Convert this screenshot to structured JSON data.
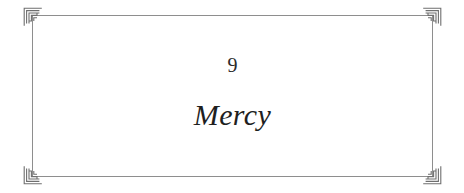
{
  "page": {
    "background_color": "#ffffff",
    "type": "book-chapter-opening-page"
  },
  "frame": {
    "rule_color": "#8e8e8e",
    "ornament_color": "#6f6f6f",
    "ornament_name": "greek-key-spiral-meander",
    "corners": [
      {
        "name": "corner-top-left"
      },
      {
        "name": "corner-top-right"
      },
      {
        "name": "corner-bottom-left"
      },
      {
        "name": "corner-bottom-right"
      }
    ]
  },
  "chapter": {
    "number": "9",
    "title": "Mercy",
    "number_color": "#2b2b2b",
    "title_color": "#1f1f1f"
  }
}
